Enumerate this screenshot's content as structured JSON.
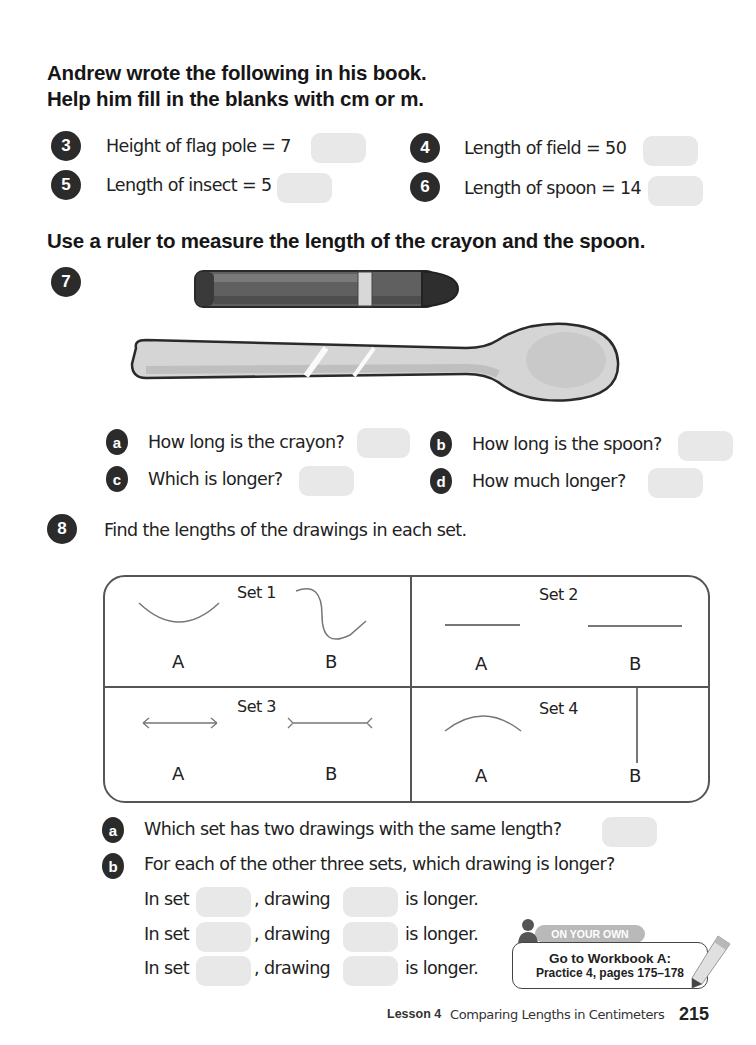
{
  "section1": {
    "heading_line1": "Andrew wrote the following in his book.",
    "heading_line2": "Help him fill in the blanks with cm or m.",
    "items": [
      {
        "number": "3",
        "text": "Height of flag pole = 7"
      },
      {
        "number": "4",
        "text": "Length of field = 50"
      },
      {
        "number": "5",
        "text": "Length of insect = 5"
      },
      {
        "number": "6",
        "text": "Length of spoon = 14"
      }
    ]
  },
  "section2": {
    "heading": "Use a ruler to measure the length of the crayon and the spoon.",
    "number": "7",
    "images": [
      "crayon",
      "spoon"
    ],
    "questions": [
      {
        "letter": "a",
        "text": "How long is the crayon?"
      },
      {
        "letter": "b",
        "text": "How long is the spoon?"
      },
      {
        "letter": "c",
        "text": "Which is longer?"
      },
      {
        "letter": "d",
        "text": "How much longer?"
      }
    ]
  },
  "section3": {
    "number": "8",
    "instruction": "Find the lengths of the drawings in each set.",
    "sets": [
      {
        "label": "Set 1",
        "a": "A",
        "b": "B"
      },
      {
        "label": "Set 2",
        "a": "A",
        "b": "B"
      },
      {
        "label": "Set 3",
        "a": "A",
        "b": "B"
      },
      {
        "label": "Set 4",
        "a": "A",
        "b": "B"
      }
    ],
    "questions": [
      {
        "letter": "a",
        "text": "Which set has two drawings with the same length?"
      },
      {
        "letter": "b",
        "text": "For each of the other three sets, which drawing is longer?"
      }
    ],
    "fill_rows": [
      {
        "in_set": "In set",
        "drawing": ", drawing",
        "is_longer": "is longer."
      },
      {
        "in_set": "In set",
        "drawing": ", drawing",
        "is_longer": "is longer."
      },
      {
        "in_set": "In set",
        "drawing": ", drawing",
        "is_longer": "is longer."
      }
    ]
  },
  "on_your_own": {
    "badge": "ON YOUR OWN",
    "line1": "Go to Workbook A:",
    "line2": "Practice 4, pages 175–178"
  },
  "footer": {
    "lesson": "Lesson 4",
    "title": "Comparing Lengths in Centimeters",
    "page_number": "215"
  }
}
